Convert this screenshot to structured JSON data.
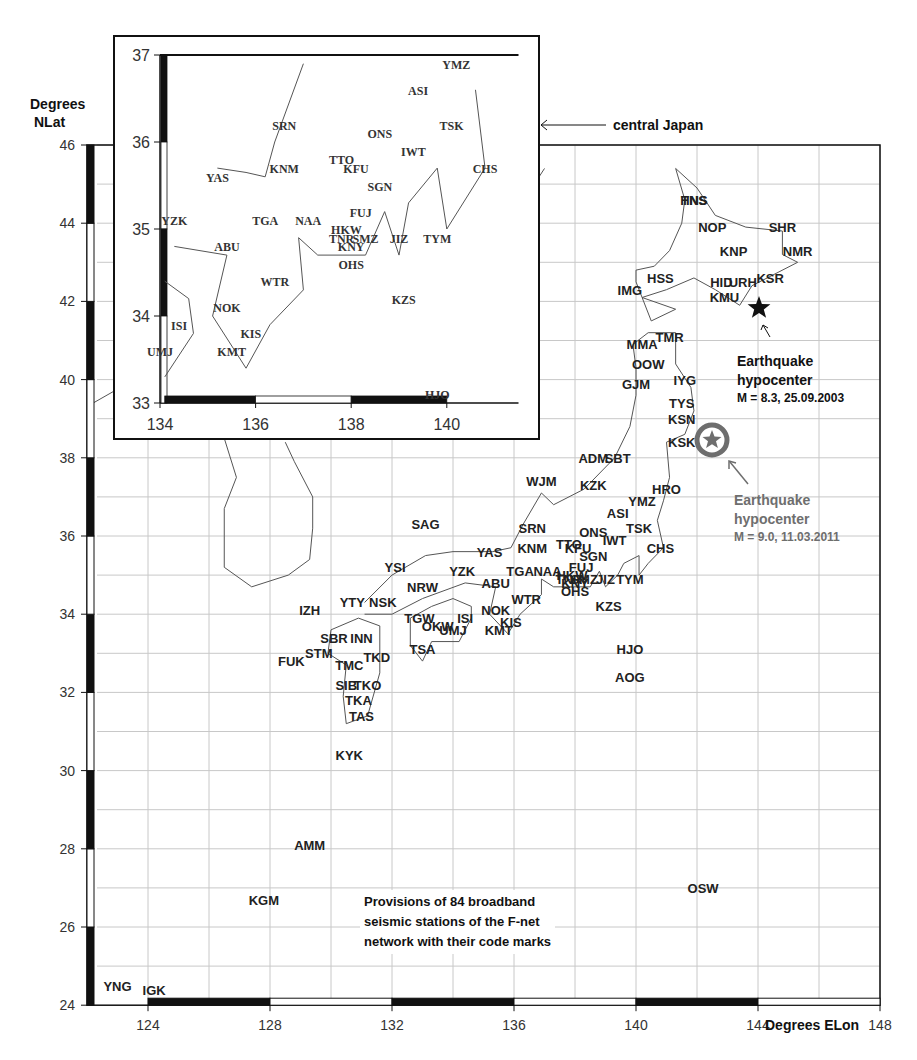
{
  "chart_data": {
    "type": "scatter",
    "title": "Provisions of 84 broadband seismic stations of the F-net network with their code marks",
    "xlabel": "Degrees ELon",
    "ylabel": "Degrees NLat",
    "xlim": [
      122,
      148
    ],
    "ylim": [
      24,
      46
    ],
    "x_ticks": [
      124,
      128,
      132,
      136,
      140,
      144,
      148
    ],
    "y_ticks": [
      24,
      26,
      28,
      30,
      32,
      34,
      36,
      38,
      40,
      42,
      44,
      46
    ],
    "grid": true,
    "stations": [
      {
        "code": "YNG",
        "lon": 123.0,
        "lat": 24.5
      },
      {
        "code": "IGK",
        "lon": 124.2,
        "lat": 24.4
      },
      {
        "code": "KGM",
        "lon": 127.8,
        "lat": 26.7
      },
      {
        "code": "AMM",
        "lon": 129.3,
        "lat": 28.1
      },
      {
        "code": "KYK",
        "lon": 130.6,
        "lat": 30.4
      },
      {
        "code": "TAS",
        "lon": 131.0,
        "lat": 31.4
      },
      {
        "code": "TKA",
        "lon": 130.9,
        "lat": 31.8
      },
      {
        "code": "SIB",
        "lon": 130.5,
        "lat": 32.2
      },
      {
        "code": "TKO",
        "lon": 131.2,
        "lat": 32.2
      },
      {
        "code": "FUK",
        "lon": 128.7,
        "lat": 32.8
      },
      {
        "code": "STM",
        "lon": 129.6,
        "lat": 33.0
      },
      {
        "code": "TMC",
        "lon": 130.6,
        "lat": 32.7
      },
      {
        "code": "TKD",
        "lon": 131.5,
        "lat": 32.9
      },
      {
        "code": "SBR",
        "lon": 130.1,
        "lat": 33.4
      },
      {
        "code": "INN",
        "lon": 131.0,
        "lat": 33.4
      },
      {
        "code": "IZH",
        "lon": 129.3,
        "lat": 34.1
      },
      {
        "code": "YTY",
        "lon": 130.7,
        "lat": 34.3
      },
      {
        "code": "NSK",
        "lon": 131.7,
        "lat": 34.3
      },
      {
        "code": "TSA",
        "lon": 133.0,
        "lat": 33.1
      },
      {
        "code": "TGW",
        "lon": 132.9,
        "lat": 33.9
      },
      {
        "code": "OKW",
        "lon": 133.5,
        "lat": 33.7
      },
      {
        "code": "UMJ",
        "lon": 134.0,
        "lat": 33.6
      },
      {
        "code": "ISI",
        "lon": 134.4,
        "lat": 33.9
      },
      {
        "code": "NOK",
        "lon": 135.4,
        "lat": 34.1
      },
      {
        "code": "KMT",
        "lon": 135.5,
        "lat": 33.6
      },
      {
        "code": "KIS",
        "lon": 135.9,
        "lat": 33.8
      },
      {
        "code": "WTR",
        "lon": 136.4,
        "lat": 34.4
      },
      {
        "code": "SAG",
        "lon": 133.1,
        "lat": 36.3
      },
      {
        "code": "YSI",
        "lon": 132.1,
        "lat": 35.2
      },
      {
        "code": "NRW",
        "lon": 133.0,
        "lat": 34.7
      },
      {
        "code": "YZK",
        "lon": 134.3,
        "lat": 35.1
      },
      {
        "code": "ABU",
        "lon": 135.4,
        "lat": 34.8
      },
      {
        "code": "YAS",
        "lon": 135.2,
        "lat": 35.6
      },
      {
        "code": "SRN",
        "lon": 136.6,
        "lat": 36.2
      },
      {
        "code": "KNM",
        "lon": 136.6,
        "lat": 35.7
      },
      {
        "code": "TGA",
        "lon": 136.2,
        "lat": 35.1
      },
      {
        "code": "NAA",
        "lon": 137.1,
        "lat": 35.1
      },
      {
        "code": "TTO",
        "lon": 137.8,
        "lat": 35.8
      },
      {
        "code": "KFU",
        "lon": 138.1,
        "lat": 35.7
      },
      {
        "code": "FUJ",
        "lon": 138.2,
        "lat": 35.2
      },
      {
        "code": "HKW",
        "lon": 137.9,
        "lat": 35.0
      },
      {
        "code": "SMZ",
        "lon": 138.3,
        "lat": 34.9
      },
      {
        "code": "TNR",
        "lon": 137.8,
        "lat": 34.9
      },
      {
        "code": "KNY",
        "lon": 138.0,
        "lat": 34.8
      },
      {
        "code": "OHS",
        "lon": 138.0,
        "lat": 34.6
      },
      {
        "code": "JIZ",
        "lon": 139.0,
        "lat": 34.9
      },
      {
        "code": "SGN",
        "lon": 138.6,
        "lat": 35.5
      },
      {
        "code": "ONS",
        "lon": 138.6,
        "lat": 36.1
      },
      {
        "code": "IWT",
        "lon": 139.3,
        "lat": 35.9
      },
      {
        "code": "TSK",
        "lon": 140.1,
        "lat": 36.2
      },
      {
        "code": "ASI",
        "lon": 139.4,
        "lat": 36.6
      },
      {
        "code": "YMZ",
        "lon": 140.2,
        "lat": 36.9
      },
      {
        "code": "CHS",
        "lon": 140.8,
        "lat": 35.7
      },
      {
        "code": "TYM",
        "lon": 139.8,
        "lat": 34.9
      },
      {
        "code": "KZS",
        "lon": 139.1,
        "lat": 34.2
      },
      {
        "code": "HJO",
        "lon": 139.8,
        "lat": 33.1
      },
      {
        "code": "AOG",
        "lon": 139.8,
        "lat": 32.4
      },
      {
        "code": "OSW",
        "lon": 142.2,
        "lat": 27.0
      },
      {
        "code": "WJM",
        "lon": 136.9,
        "lat": 37.4
      },
      {
        "code": "KZK",
        "lon": 138.6,
        "lat": 37.3
      },
      {
        "code": "ADM",
        "lon": 138.6,
        "lat": 38.0
      },
      {
        "code": "SBT",
        "lon": 139.4,
        "lat": 38.0
      },
      {
        "code": "KSK",
        "lon": 141.5,
        "lat": 38.4
      },
      {
        "code": "HRO",
        "lon": 141.0,
        "lat": 37.2
      },
      {
        "code": "KSN",
        "lon": 141.5,
        "lat": 39.0
      },
      {
        "code": "TYS",
        "lon": 141.5,
        "lat": 39.4
      },
      {
        "code": "IYG",
        "lon": 141.6,
        "lat": 40.0
      },
      {
        "code": "GJM",
        "lon": 140.0,
        "lat": 39.9
      },
      {
        "code": "OOW",
        "lon": 140.4,
        "lat": 40.4
      },
      {
        "code": "MMA",
        "lon": 140.2,
        "lat": 40.9
      },
      {
        "code": "TMR",
        "lon": 141.1,
        "lat": 41.1
      },
      {
        "code": "IMG",
        "lon": 139.8,
        "lat": 42.3
      },
      {
        "code": "HSS",
        "lon": 140.8,
        "lat": 42.6
      },
      {
        "code": "HID",
        "lon": 142.8,
        "lat": 42.5
      },
      {
        "code": "KMU",
        "lon": 142.9,
        "lat": 42.1
      },
      {
        "code": "URH",
        "lon": 143.5,
        "lat": 42.5
      },
      {
        "code": "KSR",
        "lon": 144.4,
        "lat": 42.6
      },
      {
        "code": "KNP",
        "lon": 143.2,
        "lat": 43.3
      },
      {
        "code": "NOP",
        "lon": 142.5,
        "lat": 43.9
      },
      {
        "code": "SHR",
        "lon": 144.8,
        "lat": 43.9
      },
      {
        "code": "NMR",
        "lon": 145.3,
        "lat": 43.3
      },
      {
        "code": "HNS",
        "lon": 141.9,
        "lat": 44.6
      },
      {
        "code": "TNS",
        "lon": 141.9,
        "lat": 44.6
      }
    ],
    "annotations": [
      {
        "label": "Earthquake hypocenter",
        "detail": "M = 8.3, 25.09.2003",
        "lon": 144.0,
        "lat": 41.8,
        "marker": "star",
        "color": "#111111"
      },
      {
        "label": "Earthquake hypocenter",
        "detail": "M = 9.0, 11.03.2011",
        "lon": 142.4,
        "lat": 38.3,
        "marker": "circled-star",
        "color": "#6e6e6e"
      }
    ],
    "inset": {
      "label": "central Japan",
      "xlim": [
        134,
        141.5
      ],
      "ylim": [
        33,
        37
      ],
      "x_ticks": [
        134,
        136,
        138,
        140
      ],
      "y_ticks": [
        33,
        34,
        35,
        36,
        37
      ]
    }
  },
  "labels": {
    "y_axis_title_line1": "Degrees",
    "y_axis_title_line2": "NLat",
    "x_axis_title": "Degrees ELon",
    "inset_pointer": "central Japan",
    "eq2003_title1": "Earthquake",
    "eq2003_title2": "hypocenter",
    "eq2003_detail": "M = 8.3, 25.09.2003",
    "eq2011_title1": "Earthquake",
    "eq2011_title2": "hypocenter",
    "eq2011_detail": "M = 9.0, 11.03.2011",
    "note_line1": "Provisions of 84 broadband",
    "note_line2": "seismic stations of the F-net",
    "note_line3": "network with their code marks"
  },
  "colors": {
    "ink": "#111111",
    "grid": "#c8c8c8",
    "coast": "#555555",
    "eq2011": "#6e6e6e"
  }
}
